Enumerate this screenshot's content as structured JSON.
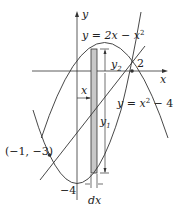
{
  "diagram": {
    "axes": {
      "x_label": "x",
      "y_label": "y"
    },
    "curves": {
      "upper": "y = 2x − x",
      "upper_exp": "2",
      "lower": "y = x",
      "lower_exp": "2",
      "lower_tail": " − 4"
    },
    "labels": {
      "x_intercept": "2",
      "point": "(−1, −3)",
      "y_min": "−4",
      "strip_x": "x",
      "y2": "y",
      "y2_sub": "2",
      "y1": "y",
      "y1_sub": "1",
      "dx": "dx"
    },
    "colors": {
      "line": "#333333",
      "strip_fill": "#c8c8c8"
    }
  }
}
